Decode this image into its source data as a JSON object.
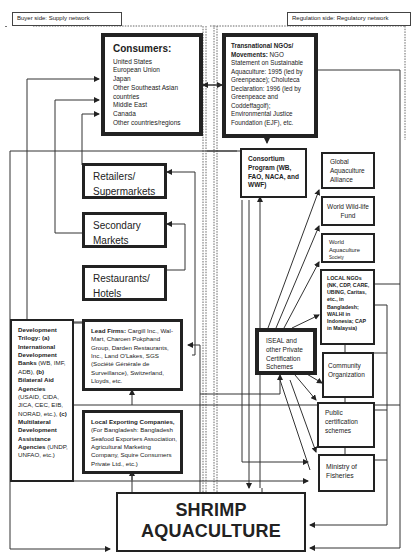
{
  "headers": {
    "buyer_side": "Buyer side: Supply network",
    "regulation_side": "Regulation side: Regulatory network"
  },
  "consumers": {
    "title": "Consumers:",
    "items": [
      "United States",
      "European Union",
      "Japan",
      "Other Southeast Asian",
      "countries",
      "Middle East",
      "Canada",
      "Other countries/regions"
    ]
  },
  "transnational": {
    "title": "Transnational NGOs/ Movements:",
    "text": "NGO Statement on Sustainable Aquaculture: 1995 (led by Greenpeace); Choluteca Declaration: 1996 (led by Greenpeace and Coddeffagolf); Environmental Justice Foundation (EJF), etc."
  },
  "retailers": {
    "label": "Retailers/ Supermarkets"
  },
  "secondary": {
    "label": "Secondary Markets"
  },
  "restaurants": {
    "label": "Restaurants/ Hotels"
  },
  "consortium": {
    "label": "Consortium Program (WB, FAO, NACA, and WWF)"
  },
  "gaa": {
    "label": "Global Aquaculture Alliance"
  },
  "wwf": {
    "label": "World Wild-life Fund"
  },
  "was": {
    "label_main": "World Aquaculture",
    "label_small": "Society"
  },
  "local_ngos": {
    "label": "LOCAL NGOs (NK, CDP, CARE, UBING, Caritas, etc., in Bangladesh; WALHI in Indonesia; CAP in Malaysia)"
  },
  "development": {
    "title_a": "Development Trilogy: (a) International Development Banks",
    "text_a": " (WB, IMF, ADB), ",
    "title_b": "(b) Bilateral Aid Agencies",
    "text_b": " (USAID, CIDA, JICA, CEC, EIB, NORAD, etc.), ",
    "title_c": "(c) Multilateral Development Assistance Agencies",
    "text_c": " (UNDP, UNFAO, etc.)"
  },
  "lead_firms": {
    "title": "Lead Firms:",
    "text": " Cargill Inc., Wal-Mart, Charoen Pokphand Group, Darden Restaurants, Inc., Land O'Lakes, SGS (Société Générale de Surveillance), Switzerland, Lloyds, etc."
  },
  "iseal": {
    "label": "ISEAL and other Private Certification Schemes"
  },
  "community": {
    "label": "Community Organization"
  },
  "public_cert": {
    "label": "Public certification schemes"
  },
  "ministry": {
    "label": "Ministry of Fisheries"
  },
  "local_exporting": {
    "title": "Local Exporting Companies,",
    "text": " (For Bangladesh: Bangladesh Seafood Exporters Association, Agricultural Marketing Company, Squire Consumers Private Ltd., etc.)"
  },
  "shrimp": {
    "label": "SHRIMP AQUACULTURE"
  }
}
